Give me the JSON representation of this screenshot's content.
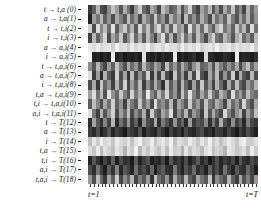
{
  "figure": {
    "type": "heatmap",
    "background": "#ffffff",
    "colormap": "grayscale"
  },
  "axes": {
    "y_labels": [
      "t → t,a (0)",
      "a → t,a(1)",
      "t → t,i(2)",
      "i → t,i(3)",
      "a → a,i(4)",
      "i → a,i(5)",
      "t → t,a,i(6)",
      "a → t,a,i(7)",
      "i → t,a,i(8)",
      "t,a → t,a,i(9)",
      "t,i → t,a,i(10)",
      "a,i → t,a,i(11)",
      "t → T(12)",
      "a → T(13)",
      "i → T(14)",
      "t,a → T(15)",
      "t,i → T(16)",
      "a,i → T(17)",
      "t,a,i → T(18)"
    ],
    "x_label_start": "t=1",
    "x_label_end": "t=T"
  },
  "chart_data": {
    "type": "heatmap",
    "title": "",
    "xlabel": "",
    "ylabel": "",
    "grid": false,
    "legend": "none",
    "colormap": "gray",
    "vmin": 0,
    "vmax": 1,
    "n_rows": 19,
    "n_cols": 44,
    "row_labels": [
      "t → t,a (0)",
      "a → t,a(1)",
      "t → t,i(2)",
      "i → t,i(3)",
      "a → a,i(4)",
      "i → a,i(5)",
      "t → t,a,i(6)",
      "a → t,a,i(7)",
      "i → t,a,i(8)",
      "t,a → t,a,i(9)",
      "t,i → t,a,i(10)",
      "a,i → t,a,i(11)",
      "t → T(12)",
      "a → T(13)",
      "i → T(14)",
      "t,a → T(15)",
      "t,i → T(16)",
      "a,i → T(17)",
      "t,a,i → T(18)"
    ],
    "col_labels": [
      "t=1",
      "t=T"
    ],
    "values": [
      [
        0.22,
        0.38,
        0.7,
        0.3,
        0.26,
        0.55,
        0.78,
        0.62,
        0.34,
        0.68,
        0.46,
        0.24,
        0.58,
        0.8,
        0.42,
        0.3,
        0.66,
        0.52,
        0.28,
        0.74,
        0.6,
        0.36,
        0.44,
        0.7,
        0.32,
        0.56,
        0.82,
        0.4,
        0.26,
        0.64,
        0.48,
        0.72,
        0.34,
        0.58,
        0.3,
        0.66,
        0.44,
        0.78,
        0.36,
        0.54,
        0.28,
        0.7,
        0.4,
        0.62
      ],
      [
        0.14,
        0.62,
        0.46,
        0.72,
        0.38,
        0.58,
        0.3,
        0.66,
        0.5,
        0.34,
        0.74,
        0.42,
        0.6,
        0.28,
        0.68,
        0.52,
        0.36,
        0.78,
        0.44,
        0.58,
        0.32,
        0.7,
        0.48,
        0.62,
        0.26,
        0.74,
        0.4,
        0.56,
        0.34,
        0.68,
        0.5,
        0.3,
        0.72,
        0.44,
        0.6,
        0.38,
        0.76,
        0.48,
        0.32,
        0.64,
        0.42,
        0.7,
        0.36,
        0.58
      ],
      [
        0.82,
        0.3,
        0.86,
        0.52,
        0.74,
        0.42,
        0.88,
        0.36,
        0.64,
        0.8,
        0.46,
        0.7,
        0.34,
        0.84,
        0.5,
        0.76,
        0.4,
        0.68,
        0.86,
        0.44,
        0.72,
        0.38,
        0.82,
        0.56,
        0.66,
        0.32,
        0.88,
        0.48,
        0.74,
        0.42,
        0.8,
        0.54,
        0.36,
        0.7,
        0.84,
        0.46,
        0.62,
        0.38,
        0.78,
        0.5,
        0.72,
        0.34,
        0.86,
        0.44
      ],
      [
        0.26,
        0.72,
        0.38,
        0.6,
        0.84,
        0.3,
        0.66,
        0.48,
        0.78,
        0.34,
        0.56,
        0.82,
        0.42,
        0.68,
        0.36,
        0.74,
        0.5,
        0.28,
        0.62,
        0.86,
        0.4,
        0.7,
        0.32,
        0.58,
        0.8,
        0.44,
        0.66,
        0.36,
        0.76,
        0.52,
        0.3,
        0.64,
        0.82,
        0.46,
        0.38,
        0.72,
        0.58,
        0.34,
        0.68,
        0.8,
        0.42,
        0.6,
        0.36,
        0.74
      ],
      [
        0.9,
        0.86,
        0.92,
        0.84,
        0.88,
        0.9,
        0.82,
        0.94,
        0.86,
        0.88,
        0.8,
        0.92,
        0.84,
        0.9,
        0.86,
        0.94,
        0.82,
        0.88,
        0.9,
        0.84,
        0.92,
        0.86,
        0.88,
        0.8,
        0.94,
        0.84,
        0.9,
        0.86,
        0.92,
        0.82,
        0.88,
        0.9,
        0.84,
        0.94,
        0.86,
        0.88,
        0.92,
        0.82,
        0.9,
        0.84,
        0.88,
        0.86,
        0.92,
        0.8
      ],
      [
        0.96,
        0.12,
        0.14,
        0.1,
        0.16,
        0.12,
        0.92,
        0.14,
        0.18,
        0.1,
        0.14,
        0.12,
        0.16,
        0.1,
        0.88,
        0.14,
        0.12,
        0.18,
        0.1,
        0.16,
        0.12,
        0.14,
        0.9,
        0.1,
        0.16,
        0.12,
        0.14,
        0.18,
        0.1,
        0.12,
        0.86,
        0.16,
        0.14,
        0.1,
        0.12,
        0.18,
        0.14,
        0.1,
        0.92,
        0.12,
        0.16,
        0.14,
        0.1,
        0.18
      ],
      [
        0.56,
        0.34,
        0.7,
        0.44,
        0.28,
        0.62,
        0.38,
        0.76,
        0.5,
        0.32,
        0.66,
        0.42,
        0.58,
        0.3,
        0.72,
        0.46,
        0.36,
        0.64,
        0.52,
        0.28,
        0.74,
        0.4,
        0.6,
        0.34,
        0.68,
        0.48,
        0.3,
        0.56,
        0.72,
        0.38,
        0.44,
        0.62,
        0.32,
        0.7,
        0.5,
        0.36,
        0.58,
        0.42,
        0.66,
        0.3,
        0.54,
        0.74,
        0.4,
        0.62
      ],
      [
        0.88,
        0.24,
        0.62,
        0.18,
        0.7,
        0.36,
        0.22,
        0.8,
        0.3,
        0.64,
        0.2,
        0.74,
        0.28,
        0.56,
        0.34,
        0.82,
        0.22,
        0.68,
        0.26,
        0.72,
        0.3,
        0.18,
        0.78,
        0.34,
        0.6,
        0.24,
        0.7,
        0.28,
        0.84,
        0.32,
        0.2,
        0.66,
        0.38,
        0.74,
        0.26,
        0.58,
        0.3,
        0.8,
        0.22,
        0.68,
        0.34,
        0.24,
        0.72,
        0.3
      ],
      [
        0.3,
        0.66,
        0.22,
        0.78,
        0.4,
        0.58,
        0.26,
        0.7,
        0.34,
        0.82,
        0.28,
        0.62,
        0.38,
        0.74,
        0.24,
        0.56,
        0.32,
        0.68,
        0.44,
        0.2,
        0.76,
        0.36,
        0.6,
        0.28,
        0.72,
        0.4,
        0.24,
        0.64,
        0.3,
        0.78,
        0.34,
        0.58,
        0.26,
        0.7,
        0.42,
        0.22,
        0.66,
        0.32,
        0.74,
        0.38,
        0.28,
        0.6,
        0.44,
        0.7
      ],
      [
        0.62,
        0.86,
        0.44,
        0.74,
        0.32,
        0.88,
        0.56,
        0.4,
        0.78,
        0.5,
        0.34,
        0.82,
        0.46,
        0.68,
        0.38,
        0.9,
        0.52,
        0.36,
        0.72,
        0.48,
        0.84,
        0.4,
        0.58,
        0.3,
        0.76,
        0.44,
        0.88,
        0.52,
        0.34,
        0.66,
        0.42,
        0.8,
        0.48,
        0.36,
        0.7,
        0.54,
        0.32,
        0.86,
        0.46,
        0.62,
        0.38,
        0.74,
        0.5,
        0.42
      ],
      [
        0.36,
        0.74,
        0.52,
        0.3,
        0.66,
        0.44,
        0.82,
        0.38,
        0.58,
        0.26,
        0.7,
        0.48,
        0.34,
        0.78,
        0.42,
        0.62,
        0.3,
        0.86,
        0.46,
        0.56,
        0.38,
        0.72,
        0.28,
        0.64,
        0.5,
        0.34,
        0.8,
        0.44,
        0.6,
        0.32,
        0.76,
        0.48,
        0.38,
        0.68,
        0.54,
        0.28,
        0.72,
        0.42,
        0.58,
        0.34,
        0.84,
        0.46,
        0.3,
        0.66
      ],
      [
        0.88,
        0.46,
        0.26,
        0.7,
        0.34,
        0.58,
        0.82,
        0.3,
        0.62,
        0.42,
        0.76,
        0.28,
        0.54,
        0.36,
        0.68,
        0.24,
        0.8,
        0.44,
        0.32,
        0.64,
        0.5,
        0.86,
        0.28,
        0.56,
        0.38,
        0.72,
        0.3,
        0.6,
        0.46,
        0.24,
        0.78,
        0.34,
        0.66,
        0.42,
        0.28,
        0.84,
        0.5,
        0.32,
        0.58,
        0.7,
        0.26,
        0.62,
        0.4,
        0.74
      ],
      [
        0.18,
        0.64,
        0.34,
        0.2,
        0.52,
        0.26,
        0.7,
        0.16,
        0.44,
        0.28,
        0.6,
        0.22,
        0.38,
        0.14,
        0.56,
        0.3,
        0.24,
        0.66,
        0.18,
        0.48,
        0.32,
        0.2,
        0.58,
        0.26,
        0.4,
        0.16,
        0.62,
        0.22,
        0.34,
        0.28,
        0.54,
        0.18,
        0.46,
        0.24,
        0.68,
        0.3,
        0.2,
        0.56,
        0.26,
        0.38,
        0.16,
        0.5,
        0.28,
        0.22
      ],
      [
        0.24,
        0.16,
        0.3,
        0.12,
        0.2,
        0.34,
        0.14,
        0.26,
        0.18,
        0.1,
        0.28,
        0.22,
        0.16,
        0.32,
        0.12,
        0.24,
        0.18,
        0.14,
        0.3,
        0.2,
        0.1,
        0.26,
        0.16,
        0.22,
        0.12,
        0.28,
        0.18,
        0.14,
        0.24,
        0.3,
        0.16,
        0.2,
        0.12,
        0.26,
        0.22,
        0.14,
        0.28,
        0.18,
        0.1,
        0.24,
        0.16,
        0.3,
        0.2,
        0.12
      ],
      [
        0.74,
        0.9,
        0.8,
        0.94,
        0.84,
        0.88,
        0.78,
        0.92,
        0.86,
        0.82,
        0.9,
        0.76,
        0.88,
        0.94,
        0.8,
        0.84,
        0.92,
        0.78,
        0.86,
        0.9,
        0.82,
        0.94,
        0.76,
        0.88,
        0.84,
        0.8,
        0.92,
        0.86,
        0.78,
        0.9,
        0.82,
        0.94,
        0.8,
        0.88,
        0.76,
        0.84,
        0.92,
        0.86,
        0.78,
        0.9,
        0.94,
        0.82,
        0.8,
        0.88
      ],
      [
        0.86,
        0.78,
        0.92,
        0.74,
        0.88,
        0.82,
        0.76,
        0.9,
        0.84,
        0.7,
        0.88,
        0.8,
        0.94,
        0.72,
        0.86,
        0.78,
        0.9,
        0.82,
        0.76,
        0.88,
        0.74,
        0.92,
        0.8,
        0.84,
        0.7,
        0.9,
        0.78,
        0.86,
        0.82,
        0.74,
        0.88,
        0.92,
        0.76,
        0.84,
        0.8,
        0.7,
        0.9,
        0.86,
        0.78,
        0.82,
        0.88,
        0.74,
        0.92,
        0.8
      ],
      [
        0.14,
        0.34,
        0.2,
        0.1,
        0.26,
        0.16,
        0.38,
        0.12,
        0.3,
        0.18,
        0.22,
        0.1,
        0.36,
        0.14,
        0.24,
        0.32,
        0.12,
        0.2,
        0.16,
        0.28,
        0.1,
        0.34,
        0.18,
        0.24,
        0.14,
        0.3,
        0.12,
        0.22,
        0.36,
        0.16,
        0.26,
        0.1,
        0.2,
        0.32,
        0.14,
        0.24,
        0.18,
        0.28,
        0.12,
        0.34,
        0.2,
        0.16,
        0.3,
        0.22
      ],
      [
        0.3,
        0.18,
        0.46,
        0.24,
        0.12,
        0.38,
        0.2,
        0.52,
        0.16,
        0.34,
        0.26,
        0.14,
        0.44,
        0.22,
        0.3,
        0.18,
        0.4,
        0.12,
        0.28,
        0.36,
        0.2,
        0.16,
        0.48,
        0.24,
        0.14,
        0.32,
        0.22,
        0.42,
        0.18,
        0.26,
        0.12,
        0.38,
        0.2,
        0.3,
        0.16,
        0.44,
        0.24,
        0.14,
        0.34,
        0.22,
        0.18,
        0.4,
        0.26,
        0.12
      ],
      [
        0.6,
        0.3,
        0.74,
        0.42,
        0.22,
        0.66,
        0.36,
        0.8,
        0.28,
        0.54,
        0.38,
        0.7,
        0.26,
        0.48,
        0.34,
        0.62,
        0.2,
        0.76,
        0.44,
        0.32,
        0.58,
        0.24,
        0.68,
        0.4,
        0.3,
        0.72,
        0.36,
        0.26,
        0.64,
        0.46,
        0.34,
        0.78,
        0.22,
        0.56,
        0.42,
        0.3,
        0.7,
        0.38,
        0.24,
        0.66,
        0.32,
        0.5,
        0.28,
        0.6
      ]
    ]
  }
}
